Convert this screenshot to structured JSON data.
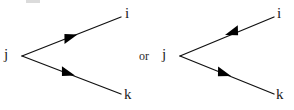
{
  "figure": {
    "width": 294,
    "height": 110,
    "background": "#ffffff",
    "stroke_color": "#111111",
    "arrow_fill": "#000000",
    "conjunction": "or",
    "diagrams": [
      {
        "id": "left-vertex-diagram",
        "vertex": {
          "x": 22,
          "y": 56
        },
        "labels": {
          "vertex": "j",
          "upper_endpoint": "i",
          "lower_endpoint": "k"
        },
        "legs": [
          {
            "id": "left-upper-leg",
            "from_label": "j",
            "to_label": "i",
            "start": {
              "x": 22,
              "y": 56
            },
            "end": {
              "x": 121,
              "y": 17
            },
            "arrow_direction": "outgoing",
            "arrow_position_fraction": 0.54
          },
          {
            "id": "left-lower-leg",
            "from_label": "j",
            "to_label": "k",
            "start": {
              "x": 22,
              "y": 56
            },
            "end": {
              "x": 121,
              "y": 94
            },
            "arrow_direction": "outgoing",
            "arrow_position_fraction": 0.51
          }
        ]
      },
      {
        "id": "right-vertex-diagram",
        "vertex": {
          "x": 180,
          "y": 56
        },
        "labels": {
          "vertex": "j",
          "upper_endpoint": "i",
          "lower_endpoint": "k"
        },
        "legs": [
          {
            "id": "right-upper-leg",
            "from_label": "i",
            "to_label": "j",
            "start": {
              "x": 180,
              "y": 56
            },
            "end": {
              "x": 274,
              "y": 17
            },
            "arrow_direction": "incoming",
            "arrow_position_fraction": 0.5
          },
          {
            "id": "right-lower-leg",
            "from_label": "j",
            "to_label": "k",
            "start": {
              "x": 180,
              "y": 56
            },
            "end": {
              "x": 274,
              "y": 94
            },
            "arrow_direction": "outgoing",
            "arrow_position_fraction": 0.5
          }
        ]
      }
    ]
  }
}
